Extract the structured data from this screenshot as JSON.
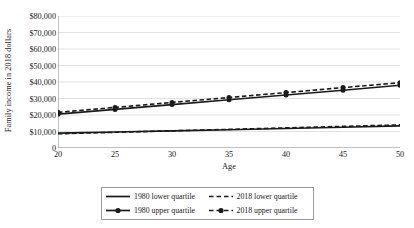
{
  "chart_data": {
    "type": "line",
    "title": "",
    "xlabel": "Age",
    "ylabel": "Family income in 2018 dollars",
    "x": [
      20,
      25,
      30,
      35,
      40,
      45,
      50
    ],
    "xlim": [
      20,
      50
    ],
    "ylim": [
      0,
      80000
    ],
    "xticks": [
      "20",
      "25",
      "30",
      "35",
      "40",
      "45",
      "50"
    ],
    "yticks": [
      "0",
      "$10,000",
      "$20,000",
      "$30,000",
      "$40,000",
      "$50,000",
      "$60,000",
      "$70,000",
      "$80,000"
    ],
    "ytick_values": [
      0,
      10000,
      20000,
      30000,
      40000,
      50000,
      60000,
      70000,
      80000
    ],
    "grid": "horizontal",
    "legend_position": "bottom",
    "series": [
      {
        "name": "1980 lower quartile",
        "style": "solid",
        "marker": "none",
        "color": "#1a1a1a",
        "values": [
          9000,
          9700,
          10400,
          11100,
          11800,
          12600,
          13400
        ]
      },
      {
        "name": "2018 lower quartile",
        "style": "dashed",
        "marker": "none",
        "color": "#1a1a1a",
        "values": [
          8600,
          9500,
          10400,
          11300,
          12200,
          13100,
          14000
        ]
      },
      {
        "name": "1980 upper quartile",
        "style": "solid",
        "marker": "circle",
        "color": "#1a1a1a",
        "values": [
          20500,
          23400,
          26300,
          29200,
          32100,
          35000,
          38000
        ]
      },
      {
        "name": "2018 upper quartile",
        "style": "dashed",
        "marker": "circle",
        "color": "#1a1a1a",
        "values": [
          21600,
          24600,
          27600,
          30600,
          33600,
          36600,
          39600
        ]
      }
    ]
  },
  "axis": {
    "y_title": "Family income in 2018 dollars",
    "x_title": "Age"
  },
  "legend": {
    "items": [
      {
        "label": "1980 lower quartile"
      },
      {
        "label": "2018 lower quartile"
      },
      {
        "label": "1980 upper quartile"
      },
      {
        "label": "2018 upper quartile"
      }
    ]
  },
  "colors": {
    "line": "#1a1a1a",
    "grid": "#d9d9d9",
    "axis": "#808080",
    "legend_border": "#9a9a9a"
  }
}
